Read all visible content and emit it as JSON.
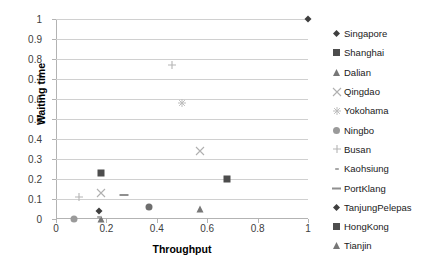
{
  "chart_data": {
    "type": "scatter",
    "title": "",
    "xlabel": "Throughput",
    "ylabel": "Waiting time",
    "xlim": [
      0,
      1
    ],
    "ylim": [
      0,
      1
    ],
    "xticks": [
      "0",
      "0.2",
      "0.4",
      "0.6",
      "0.8",
      "1"
    ],
    "xtick_values": [
      0,
      0.2,
      0.4,
      0.6,
      0.8,
      1
    ],
    "yticks": [
      "0",
      "0.1",
      "0.2",
      "0.3",
      "0.4",
      "0.5",
      "0.6",
      "0.7",
      "0.8",
      "0.9",
      "1"
    ],
    "ytick_values": [
      0,
      0.1,
      0.2,
      0.3,
      0.4,
      0.5,
      0.6,
      0.7,
      0.8,
      0.9,
      1
    ],
    "grid": "horizontal",
    "legend_position": "right",
    "series": [
      {
        "name": "Singapore",
        "marker": "diamond-filled",
        "color": "#3f3f3f",
        "size": 7,
        "points": [
          {
            "x": 1.0,
            "y": 1.0
          }
        ]
      },
      {
        "name": "Shanghai",
        "marker": "square-filled",
        "color": "#4d4d4d",
        "size": 7,
        "points": [
          {
            "x": 0.18,
            "y": 0.23
          }
        ]
      },
      {
        "name": "Dalian",
        "marker": "triangle-filled",
        "color": "#777777",
        "size": 7,
        "points": [
          {
            "x": 0.18,
            "y": 0.0
          }
        ]
      },
      {
        "name": "Qingdao",
        "marker": "cross-x",
        "color": "#b0b0b0",
        "size": 8,
        "points": [
          {
            "x": 0.18,
            "y": 0.13
          }
        ]
      },
      {
        "name": "Yokohama",
        "marker": "asterisk",
        "color": "#bdbdbd",
        "size": 8,
        "points": [
          {
            "x": 0.5,
            "y": 0.58
          }
        ]
      },
      {
        "name": "Ningbo",
        "marker": "circle-filled",
        "color": "#9a9a9a",
        "size": 7,
        "points": [
          {
            "x": 0.07,
            "y": 0.0
          }
        ]
      },
      {
        "name": "Busan",
        "marker": "plus",
        "color": "#b5b5b5",
        "size": 8,
        "points": [
          {
            "x": 0.09,
            "y": 0.11
          },
          {
            "x": 0.46,
            "y": 0.77
          }
        ]
      },
      {
        "name": "Kaohsiung",
        "marker": "dash-small",
        "color": "#a8a8a8",
        "size": 6,
        "points": [
          {
            "x": 0.17,
            "y": 0.01
          }
        ]
      },
      {
        "name": "PortKlang",
        "marker": "dash",
        "color": "#8f8f8f",
        "size": 9,
        "points": [
          {
            "x": 0.27,
            "y": 0.12
          }
        ]
      },
      {
        "name": "TanjungPelepas",
        "marker": "diamond-filled",
        "color": "#3f3f3f",
        "size": 7,
        "points": [
          {
            "x": 0.17,
            "y": 0.04
          }
        ]
      },
      {
        "name": "HongKong",
        "marker": "square-filled",
        "color": "#4d4d4d",
        "size": 7,
        "points": [
          {
            "x": 0.68,
            "y": 0.2
          }
        ]
      },
      {
        "name": "Tianjin",
        "marker": "triangle-filled",
        "color": "#777777",
        "size": 7,
        "points": [
          {
            "x": 0.57,
            "y": 0.05
          }
        ]
      }
    ],
    "extra_points": [
      {
        "series": "Qingdao",
        "x": 0.57,
        "y": 0.34,
        "marker": "cross-x",
        "color": "#b0b0b0",
        "size": 8
      },
      {
        "series": "Ningbo",
        "x": 0.37,
        "y": 0.06,
        "marker": "circle-filled",
        "color": "#6e6e6e",
        "size": 7
      }
    ],
    "colors": {
      "grid": "#d0d0d0",
      "axis": "#b3b3b3",
      "text": "#404040",
      "title": "#000000",
      "background": "#ffffff"
    }
  }
}
